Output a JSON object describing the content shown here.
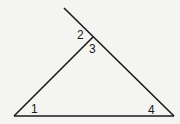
{
  "diagram": {
    "type": "triangle-with-exterior-angle",
    "line_color": "#1a1a1a",
    "background": "#f4f4f2",
    "vertices": {
      "bottom_left": [
        14,
        116
      ],
      "bottom_right": [
        174,
        116
      ],
      "apex": [
        93,
        37
      ]
    },
    "extension_end": [
      64,
      8
    ],
    "angles": [
      {
        "id": "1",
        "label": "1",
        "description": "interior angle at bottom-left vertex"
      },
      {
        "id": "2",
        "label": "2",
        "description": "exterior angle at apex"
      },
      {
        "id": "3",
        "label": "3",
        "description": "interior angle at apex"
      },
      {
        "id": "4",
        "label": "4",
        "description": "interior angle at bottom-right vertex"
      }
    ]
  }
}
